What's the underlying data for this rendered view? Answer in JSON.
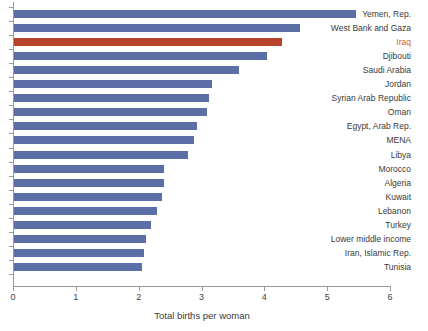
{
  "chart_data": {
    "type": "bar",
    "orientation": "horizontal",
    "title": "",
    "xlabel": "Total births per woman",
    "ylabel": "",
    "xlim": [
      0,
      6
    ],
    "xticks": [
      0,
      1,
      2,
      3,
      4,
      5,
      6
    ],
    "xtick_labels": [
      "0",
      "1",
      "2",
      "3",
      "4",
      "5",
      "6"
    ],
    "grid": false,
    "legend": "none",
    "highlight_category": "Iraq",
    "colors": {
      "bar": "#5b6ea5",
      "highlight_bar": "#b8432a",
      "highlight_label": "#d2603c",
      "axis": "#9a9a9a",
      "text": "#3a3a3a",
      "background": "#ffffff"
    },
    "categories": [
      "Yemen, Rep.",
      "West Bank and Gaza",
      "Iraq",
      "Djibouti",
      "Saudi Arabia",
      "Jordan",
      "Syrian Arab Republic",
      "Oman",
      "Egypt, Arab Rep.",
      "MENA",
      "Libya",
      "Morocco",
      "Algeria",
      "Kuwait",
      "Lebanon",
      "Turkey",
      "Lower middle income",
      "Iran, Islamic Rep.",
      "Tunisia"
    ],
    "values": [
      5.46,
      4.57,
      4.28,
      4.04,
      3.6,
      3.17,
      3.12,
      3.09,
      2.93,
      2.88,
      2.79,
      2.4,
      2.4,
      2.37,
      2.29,
      2.2,
      2.12,
      2.09,
      2.05
    ]
  }
}
